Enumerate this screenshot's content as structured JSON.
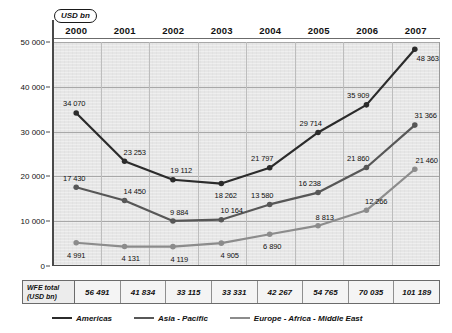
{
  "unit_badge": "USD bn",
  "chart_data": {
    "type": "line",
    "title": "",
    "xlabel": "",
    "ylabel": "USD bn",
    "categories": [
      "2000",
      "2001",
      "2002",
      "2003",
      "2004",
      "2005",
      "2006",
      "2007"
    ],
    "ylim": [
      0,
      50000
    ],
    "yticks": [
      0,
      10000,
      20000,
      30000,
      40000,
      50000
    ],
    "ytick_labels": [
      "0",
      "10 000",
      "20 000",
      "30 000",
      "40 000",
      "50 000"
    ],
    "grid": true,
    "legend_position": "bottom",
    "series": [
      {
        "name": "Americas",
        "color": "#2b2b2b",
        "values": [
          34070,
          23253,
          19112,
          18262,
          21797,
          29714,
          35909,
          48363
        ],
        "labels": [
          "34 070",
          "23 253",
          "19 112",
          "18 262",
          "21 797",
          "29 714",
          "35 909",
          "48 363"
        ]
      },
      {
        "name": "Asia - Pacific",
        "color": "#575757",
        "values": [
          17430,
          14450,
          9884,
          10164,
          13580,
          16238,
          21860,
          31366
        ],
        "labels": [
          "17 430",
          "14 450",
          "9 884",
          "10 164",
          "13 580",
          "16 238",
          "21 860",
          "31 366"
        ]
      },
      {
        "name": "Europe - Africa - Middle East",
        "color": "#8c8c8c",
        "values": [
          4991,
          4131,
          4119,
          4905,
          6890,
          8813,
          12266,
          21460
        ],
        "labels": [
          "4 991",
          "4 131",
          "4 119",
          "4 905",
          "6 890",
          "8 813",
          "12 266",
          "21 460"
        ]
      }
    ]
  },
  "total_row": {
    "header_line1": "WFE total",
    "header_line2": "(USD bn)",
    "values": [
      "56 491",
      "41 834",
      "33 115",
      "33 331",
      "42 267",
      "54 765",
      "70 035",
      "101 189"
    ]
  }
}
